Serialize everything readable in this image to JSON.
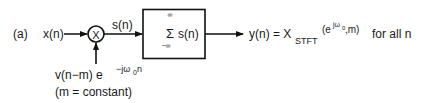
{
  "diagram": {
    "panel_label": "(a)",
    "input_label": "x(n)",
    "multiplier_symbol": "X",
    "product_label": "s(n)",
    "summer": {
      "sigma": "Σ",
      "upper_limit": "∞",
      "lower_limit": "−∞",
      "operand": "s(n)"
    },
    "modulator": {
      "main": "v(n−m) e",
      "exponent": "−jω",
      "exponent_sub": "0",
      "exponent_tail": "n",
      "note": "(m = constant)"
    },
    "output": {
      "lhs": "y(n) = X",
      "subscript": "STFT",
      "arg_open": "(e",
      "arg_exp": "jω",
      "arg_exp_sub": "0",
      "arg_close": ",m)",
      "tail": "for all n"
    },
    "colors": {
      "stroke": "#111111",
      "text": "#1a1a1a",
      "background": "#ffffff"
    }
  }
}
